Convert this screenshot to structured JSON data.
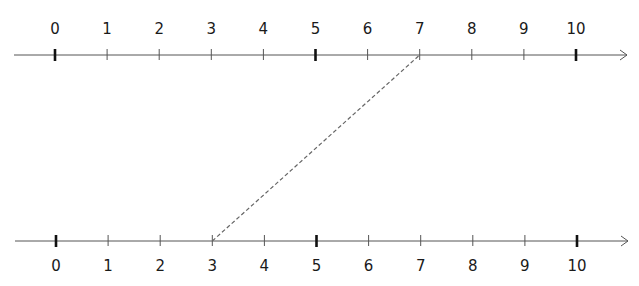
{
  "diagram": {
    "type": "double number line",
    "top_line": {
      "labels": [
        "0",
        "1",
        "2",
        "3",
        "4",
        "5",
        "6",
        "7",
        "8",
        "9",
        "10"
      ],
      "major_ticks": [
        "0",
        "5",
        "10"
      ],
      "arrow": "right"
    },
    "bottom_line": {
      "labels": [
        "0",
        "1",
        "2",
        "3",
        "4",
        "5",
        "6",
        "7",
        "8",
        "9",
        "10"
      ],
      "major_ticks": [
        "0",
        "5",
        "10"
      ],
      "arrow": "right"
    },
    "connector": {
      "style": "dashed",
      "from": {
        "line": "bottom",
        "value": "3"
      },
      "to": {
        "line": "top",
        "value": "7"
      }
    }
  },
  "chart_data": {
    "type": "diagram",
    "title": "",
    "number_lines": [
      {
        "position": "top",
        "min": 0,
        "max": 10,
        "ticks": [
          0,
          1,
          2,
          3,
          4,
          5,
          6,
          7,
          8,
          9,
          10
        ],
        "major_ticks": [
          0,
          5,
          10
        ]
      },
      {
        "position": "bottom",
        "min": 0,
        "max": 10,
        "ticks": [
          0,
          1,
          2,
          3,
          4,
          5,
          6,
          7,
          8,
          9,
          10
        ],
        "major_ticks": [
          0,
          5,
          10
        ]
      }
    ],
    "annotations": [
      {
        "type": "dashed-line",
        "from": {
          "line": "bottom",
          "value": 3
        },
        "to": {
          "line": "top",
          "value": 7
        }
      }
    ]
  },
  "colors": {
    "axis": "#555555",
    "tick": "#555555",
    "major_tick": "#111111",
    "connector": "#666666",
    "text": "#1a1a1a"
  }
}
